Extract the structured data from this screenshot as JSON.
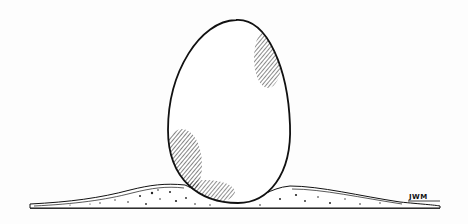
{
  "illustration": {
    "subject": "egg standing upright on a mound of sand",
    "signature": "JWM",
    "colors": {
      "ink": "#111111",
      "paper": "#fdfdfd"
    }
  }
}
